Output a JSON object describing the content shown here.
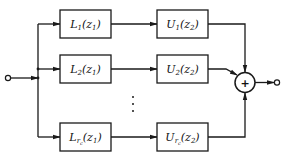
{
  "diagram": {
    "type": "parallel-block-diagram",
    "input_node": "input-terminal",
    "output_node": "output-terminal",
    "summing_junction": {
      "symbol": "+"
    },
    "branches": [
      {
        "first_block": {
          "name": "L",
          "subscript": "1",
          "arg": "z",
          "arg_sub": "1",
          "text": "L1(z1)"
        },
        "second_block": {
          "name": "U",
          "subscript": "1",
          "arg": "z",
          "arg_sub": "2",
          "text": "U1(z2)"
        }
      },
      {
        "first_block": {
          "name": "L",
          "subscript": "2",
          "arg": "z",
          "arg_sub": "1",
          "text": "L2(z1)"
        },
        "second_block": {
          "name": "U",
          "subscript": "2",
          "arg": "z",
          "arg_sub": "2",
          "text": "U2(z2)"
        }
      },
      {
        "first_block": {
          "name": "L",
          "subscript": "r_c",
          "sub_main": "r",
          "sub_sub": "c",
          "arg": "z",
          "arg_sub": "1",
          "text": "Lrc(z1)"
        },
        "second_block": {
          "name": "U",
          "subscript": "r_c",
          "sub_main": "r",
          "sub_sub": "c",
          "arg": "z",
          "arg_sub": "2",
          "text": "Urc(z2)"
        }
      }
    ],
    "ellipsis": "⋮",
    "colors": {
      "line": "#1a1a1a",
      "background": "#ffffff"
    }
  }
}
